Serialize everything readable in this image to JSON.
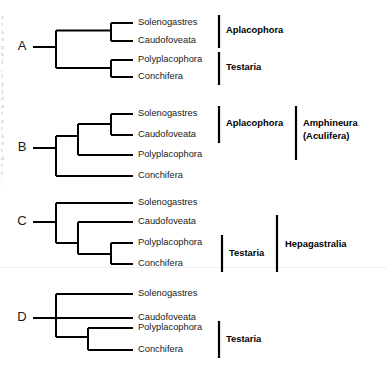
{
  "figure": {
    "background_color": "#ffffff",
    "line_color": "#000000",
    "taxa": [
      "Solenogastres",
      "Caudofoveata",
      "Polyplacophora",
      "Conchifera"
    ],
    "panels": [
      {
        "letter": "A",
        "tips": [
          {
            "label": "Solenogastres"
          },
          {
            "label": "Caudofoveata"
          },
          {
            "label": "Polyplacophora"
          },
          {
            "label": "Conchifera"
          }
        ],
        "groups": [
          {
            "label": "Aplacophora",
            "spans": [
              "Solenogastres",
              "Caudofoveata"
            ],
            "column": 1
          },
          {
            "label": "Testaria",
            "spans": [
              "Polyplacophora",
              "Conchifera"
            ],
            "column": 1
          }
        ]
      },
      {
        "letter": "B",
        "tips": [
          {
            "label": "Solenogastres"
          },
          {
            "label": "Caudofoveata"
          },
          {
            "label": "Polyplacophora"
          },
          {
            "label": "Conchifera"
          }
        ],
        "groups": [
          {
            "label": "Aplacophora",
            "spans": [
              "Solenogastres",
              "Caudofoveata"
            ],
            "column": 1
          },
          {
            "label": "Amphineura",
            "label2": "(Aculifera)",
            "spans": [
              "Solenogastres",
              "Polyplacophora"
            ],
            "column": 2
          }
        ]
      },
      {
        "letter": "C",
        "tips": [
          {
            "label": "Solenogastres"
          },
          {
            "label": "Caudofoveata"
          },
          {
            "label": "Polyplacophora"
          },
          {
            "label": "Conchifera"
          }
        ],
        "groups": [
          {
            "label": "Testaria",
            "spans": [
              "Polyplacophora",
              "Conchifera"
            ],
            "column": 1
          },
          {
            "label": "Hepagastralia",
            "spans": [
              "Caudofoveata",
              "Conchifera"
            ],
            "column": 2
          }
        ]
      },
      {
        "letter": "D",
        "tips": [
          {
            "label": "Solenogastres"
          },
          {
            "label": "Caudofoveata"
          },
          {
            "label": "Polyplacophora"
          },
          {
            "label": "Conchifera"
          }
        ],
        "groups": [
          {
            "label": "Testaria",
            "spans": [
              "Polyplacophora",
              "Conchifera"
            ],
            "column": 1
          }
        ]
      }
    ],
    "edge_fragments": [
      "a",
      "t",
      "a",
      "o",
      "a",
      "s",
      ")",
      ",",
      "r",
      "y",
      ")",
      "a",
      "n",
      "t",
      "e",
      "r",
      "a",
      "o",
      "r",
      "d",
      "t",
      "r",
      ";",
      "."
    ]
  }
}
